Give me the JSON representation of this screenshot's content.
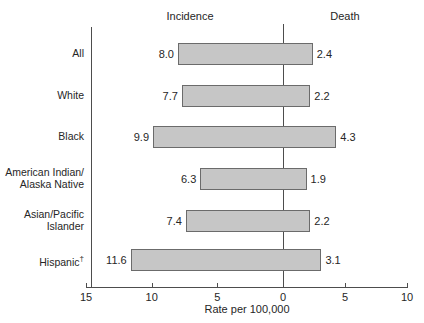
{
  "headers": {
    "left": "Incidence",
    "right": "Death"
  },
  "axis": {
    "title": "Rate per 100,000",
    "ticks": [
      "15",
      "10",
      "5",
      "0",
      "5",
      "10"
    ],
    "tick_values": [
      -15,
      -10,
      -5,
      0,
      5,
      10
    ]
  },
  "rows": [
    {
      "label": "All",
      "incidence": "8.0",
      "death": "2.4"
    },
    {
      "label": "White",
      "incidence": "7.7",
      "death": "2.2"
    },
    {
      "label": "Black",
      "incidence": "9.9",
      "death": "4.3"
    },
    {
      "label": "American Indian/\nAlaska Native",
      "incidence": "6.3",
      "death": "1.9"
    },
    {
      "label": "Asian/Pacific\nIslander",
      "incidence": "7.4",
      "death": "2.2"
    },
    {
      "label": "Hispanic†",
      "incidence": "11.6",
      "death": "3.1"
    }
  ],
  "colors": {
    "bar_fill": "#c6c6c6",
    "bar_stroke": "#6b6b6b",
    "axis": "#4d4d4d",
    "text": "#262626",
    "background": "#ffffff"
  },
  "chart_data": {
    "type": "bar",
    "title": "",
    "subtitle": "",
    "orientation": "horizontal-diverging",
    "categories": [
      "All",
      "White",
      "Black",
      "American Indian/Alaska Native",
      "Asian/Pacific Islander",
      "Hispanic†"
    ],
    "series": [
      {
        "name": "Incidence",
        "values": [
          8.0,
          7.7,
          9.9,
          6.3,
          7.4,
          11.6
        ],
        "direction": "left"
      },
      {
        "name": "Death",
        "values": [
          2.4,
          2.2,
          4.3,
          1.9,
          2.2,
          3.1
        ],
        "direction": "right"
      }
    ],
    "xlabel": "Rate per 100,000",
    "ylabel": "",
    "xlim": [
      -15,
      10
    ],
    "xticks": [
      -15,
      -10,
      -5,
      0,
      5,
      10
    ],
    "xticklabels": [
      "15",
      "10",
      "5",
      "0",
      "5",
      "10"
    ],
    "grid": false,
    "legend": "none",
    "legend_position": "top-as-column-headers"
  }
}
